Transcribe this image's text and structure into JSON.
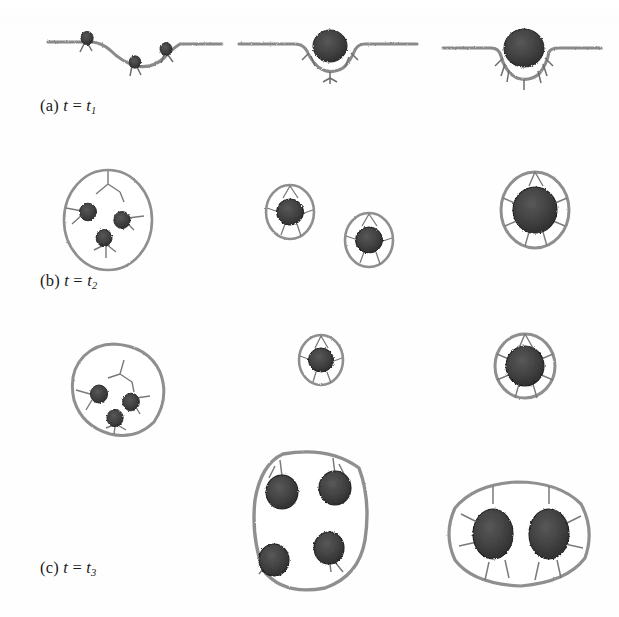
{
  "figure": {
    "type": "simulation-snapshot-grid",
    "rows": 3,
    "columns": 3,
    "background_color": "#ffffff",
    "membrane_color": "#8c8c8c",
    "membrane_dark_color": "#6e6e6e",
    "particle_color": "#3a3a3a",
    "particle_edge_color": "#1f1f1f",
    "ligand_color": "#555555",
    "caption_color": "#1a1a1a"
  },
  "captions": [
    {
      "id": "caption-a",
      "prefix": "(a)",
      "variable": "t",
      "equals": "=",
      "value": "t",
      "subscript": "1",
      "full": "(a) t = t1"
    },
    {
      "id": "caption-b",
      "prefix": "(b)",
      "variable": "t",
      "equals": "=",
      "value": "t",
      "subscript": "2",
      "full": "(b) t = t2"
    },
    {
      "id": "caption-c",
      "prefix": "(c)",
      "variable": "t",
      "equals": "=",
      "value": "t",
      "subscript": "3",
      "full": "(c) t = t3"
    }
  ],
  "panels": [
    {
      "id": "panel-a1",
      "row": "a",
      "column": 1,
      "state": "flat membrane with three adhered nanoparticles forming a shallow dimple",
      "membrane": "flat-dimpled",
      "particle_count": 3,
      "vesicle": false,
      "attached": true
    },
    {
      "id": "panel-a2",
      "row": "a",
      "column": 2,
      "state": "membrane partially wrapping a single nanoparticle, shallow bud",
      "membrane": "partial-wrap",
      "particle_count": 1,
      "vesicle": false,
      "attached": true
    },
    {
      "id": "panel-a3",
      "row": "a",
      "column": 3,
      "state": "membrane wrapping a single larger nanoparticle more deeply",
      "membrane": "deep-wrap",
      "particle_count": 1,
      "vesicle": false,
      "attached": true
    },
    {
      "id": "panel-b1",
      "row": "b",
      "column": 1,
      "state": "large oval vesicle budding from membrane containing three nanoparticles",
      "membrane": "flat",
      "particle_count": 3,
      "vesicle": true,
      "attached": true
    },
    {
      "id": "panel-b2",
      "row": "b",
      "column": 2,
      "state": "two small detached vesicles each enclosing one nanoparticle",
      "membrane": "flat",
      "particle_count": 2,
      "vesicle": true,
      "attached": false
    },
    {
      "id": "panel-b3",
      "row": "b",
      "column": 3,
      "state": "vesicle still attached to membrane tightly wrapping one nanoparticle",
      "membrane": "flat",
      "particle_count": 1,
      "vesicle": true,
      "attached": true
    },
    {
      "id": "panel-c1",
      "row": "c",
      "column": 1,
      "state": "detached rounded vesicle containing three nanoparticles",
      "membrane": "flat",
      "particle_count": 3,
      "vesicle": true,
      "attached": false
    },
    {
      "id": "panel-c2",
      "row": "c",
      "column": 2,
      "state": "small detached vesicle with one nanoparticle and a large detached vesicle with four nanoparticles",
      "membrane": "flat",
      "particle_count": 5,
      "vesicle": true,
      "attached": false
    },
    {
      "id": "panel-c3",
      "row": "c",
      "column": 3,
      "state": "detached vesicle tightly wrapping one nanoparticle and a large vesicle with two nanoparticles",
      "membrane": "flat",
      "particle_count": 3,
      "vesicle": true,
      "attached": false
    }
  ]
}
